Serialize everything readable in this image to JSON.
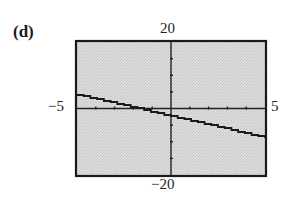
{
  "panel": {
    "label": "(d)"
  },
  "axes_labels": {
    "ymax": "20",
    "ymin": "−20",
    "xmin": "−5",
    "xmax": "5"
  },
  "colors": {
    "background": "#d9d9d9",
    "frame": "#1a1a1a",
    "axis": "#222222",
    "line": "#1a1a1a"
  },
  "chart_data": {
    "type": "line",
    "title": "(d)",
    "xlabel": "",
    "ylabel": "",
    "xlim": [
      -5,
      5
    ],
    "ylim": [
      -20,
      20
    ],
    "xscl": 1,
    "yscl": 5,
    "tick_labels": {
      "x": [
        "−5",
        "5"
      ],
      "y": [
        "−20",
        "20"
      ]
    },
    "grid": false,
    "legend": null,
    "series": [
      {
        "name": "line",
        "x": [
          -5,
          5
        ],
        "y": [
          4.2,
          -8.8
        ]
      }
    ]
  }
}
